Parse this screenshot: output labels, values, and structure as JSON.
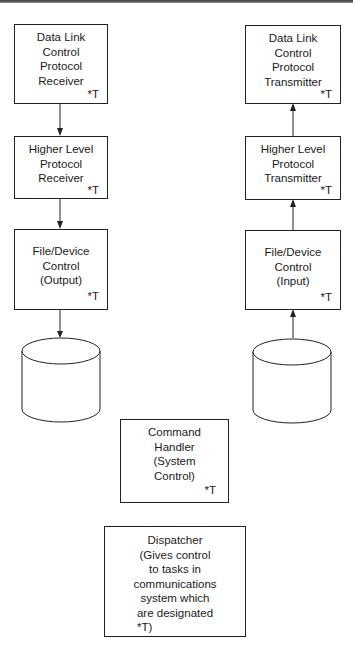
{
  "diagram": {
    "receive_chain": [
      {
        "id": "dlc-receiver",
        "lines": [
          "Data Link",
          "Control",
          "Protocol",
          "Receiver"
        ],
        "tag": "*T"
      },
      {
        "id": "hlp-receiver",
        "lines": [
          "Higher Level",
          "Protocol",
          "Receiver"
        ],
        "tag": "*T"
      },
      {
        "id": "fdc-output",
        "lines": [
          "File/Device",
          "Control",
          "(Output)"
        ],
        "tag": "*T"
      }
    ],
    "transmit_chain": [
      {
        "id": "dlc-transmitter",
        "lines": [
          "Data Link",
          "Control",
          "Protocol",
          "Transmitter"
        ],
        "tag": "*T"
      },
      {
        "id": "hlp-transmitter",
        "lines": [
          "Higher Level",
          "Protocol",
          "Transmitter"
        ],
        "tag": "*T"
      },
      {
        "id": "fdc-input",
        "lines": [
          "File/Device",
          "Control",
          "(Input)"
        ],
        "tag": "*T"
      }
    ],
    "command_handler": {
      "lines": [
        "Command",
        "Handler",
        "(System",
        "Control)"
      ],
      "tag": "*T"
    },
    "dispatcher": {
      "lines": [
        "Dispatcher",
        "(Gives control",
        "to tasks in",
        "communications",
        "system which",
        "are designated",
        "*T)"
      ]
    },
    "storage": [
      {
        "id": "output-storage",
        "shape": "cylinder"
      },
      {
        "id": "input-storage",
        "shape": "cylinder"
      }
    ],
    "edges": [
      {
        "from": "dlc-receiver",
        "to": "hlp-receiver",
        "direction": "down"
      },
      {
        "from": "hlp-receiver",
        "to": "fdc-output",
        "direction": "down"
      },
      {
        "from": "fdc-output",
        "to": "output-storage",
        "direction": "down"
      },
      {
        "from": "input-storage",
        "to": "fdc-input",
        "direction": "up"
      },
      {
        "from": "fdc-input",
        "to": "hlp-transmitter",
        "direction": "up"
      },
      {
        "from": "hlp-transmitter",
        "to": "dlc-transmitter",
        "direction": "up"
      }
    ]
  }
}
